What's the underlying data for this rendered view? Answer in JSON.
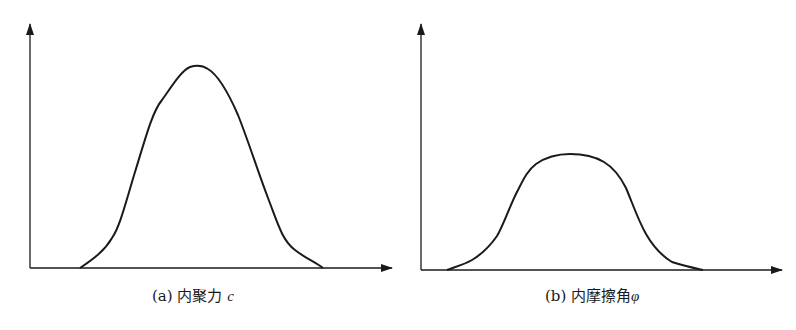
{
  "panels": [
    {
      "id": "a",
      "caption_prefix": "(a) 内聚力",
      "caption_symbol": "c",
      "curve_shape": "bell (sharp peak)"
    },
    {
      "id": "b",
      "caption_prefix": "(b) 内摩擦角",
      "caption_symbol": "φ",
      "curve_shape": "flat-topped bell"
    }
  ],
  "colors": {
    "line": "#1a1a1a",
    "background": "#ffffff"
  }
}
